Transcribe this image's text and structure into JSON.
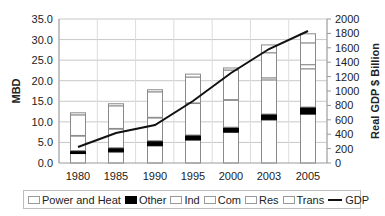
{
  "chart_data": {
    "type": "bar",
    "stacked": true,
    "title": "",
    "xlabel": "",
    "ylabel": "MBD",
    "ylabel_right": "Real GDP $ Billion",
    "ylim": [
      0,
      35
    ],
    "ylim_right": [
      0,
      2000
    ],
    "grid": true,
    "legend_position": "bottom",
    "categories": [
      "1980",
      "1985",
      "1990",
      "1995",
      "2000",
      "2003",
      "2005"
    ],
    "y_ticks": [
      "0.0",
      "5.0",
      "10.0",
      "15.0",
      "20.0",
      "25.0",
      "30.0",
      "35.0"
    ],
    "y_right_ticks": [
      "0",
      "200",
      "400",
      "600",
      "800",
      "1000",
      "1200",
      "1400",
      "1600",
      "1800",
      "2000"
    ],
    "series": [
      {
        "name": "Power and Heat",
        "color": "#ffffff",
        "values": [
          2.3,
          2.7,
          4.2,
          5.6,
          7.5,
          10.5,
          11.9
        ]
      },
      {
        "name": "Other",
        "color": "#000000",
        "values": [
          0.7,
          1.0,
          1.2,
          1.2,
          1.2,
          1.4,
          1.7
        ]
      },
      {
        "name": "Ind",
        "color": "#ffffff",
        "values": [
          3.6,
          4.6,
          5.6,
          7.7,
          6.6,
          8.3,
          9.3
        ]
      },
      {
        "name": "Com",
        "color": "#ffffff",
        "values": [
          0.1,
          0.1,
          0.1,
          0.1,
          0.1,
          0.5,
          1.0
        ]
      },
      {
        "name": "Res",
        "color": "#ffffff",
        "values": [
          5.0,
          5.5,
          6.2,
          6.3,
          7.2,
          6.1,
          5.3
        ]
      },
      {
        "name": "Trans",
        "color": "#ffffff",
        "values": [
          0.5,
          0.5,
          0.5,
          0.7,
          0.5,
          1.9,
          2.2
        ]
      }
    ],
    "line_series": [
      {
        "name": "GDP",
        "axis": "right",
        "color": "#111111",
        "values": [
          222,
          417,
          528,
          861,
          1250,
          1583,
          1833
        ]
      }
    ]
  },
  "legend": {
    "items": [
      {
        "label": "Power and Heat",
        "type": "box"
      },
      {
        "label": "Other",
        "type": "black"
      },
      {
        "label": "Ind",
        "type": "box"
      },
      {
        "label": "Com",
        "type": "box"
      },
      {
        "label": "Res",
        "type": "box"
      },
      {
        "label": "Trans",
        "type": "box"
      },
      {
        "label": "GDP",
        "type": "line"
      }
    ]
  }
}
